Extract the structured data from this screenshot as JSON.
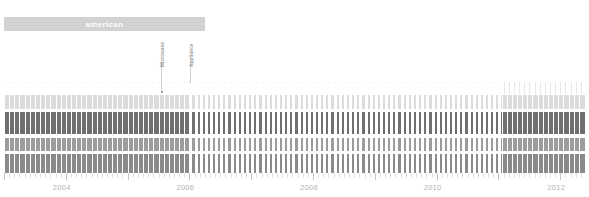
{
  "banner": {
    "label": "american",
    "color": "#d2d2d2",
    "text_color": "#ffffff"
  },
  "annotations": [
    {
      "label": "Microwave",
      "x": 161
    },
    {
      "label": "Appliance",
      "x": 190
    }
  ],
  "axis": {
    "ticks": [
      "2004",
      "2006",
      "2008",
      "2010",
      "2012"
    ],
    "color": "#b4b4b4"
  },
  "chart_data": {
    "type": "bar",
    "title": "american",
    "xlabel": "",
    "ylabel": "",
    "xlim": [
      2003.0,
      2012.4
    ],
    "grid": false,
    "legend": "none",
    "tick_labels": [
      "2004",
      "2006",
      "2008",
      "2010",
      "2012"
    ],
    "tick_values": [
      2004,
      2006,
      2008,
      2010,
      2012
    ],
    "annotations": [
      {
        "text": "Microwave",
        "x": 2005.6
      },
      {
        "text": "Appliance",
        "x": 2006.05
      }
    ],
    "series": [
      {
        "name": "band-1",
        "color": "#dcdcdc",
        "y_top": 95,
        "y_bottom": 109
      },
      {
        "name": "band-2",
        "color": "#6f6f6f",
        "y_top": 112,
        "y_bottom": 134
      },
      {
        "name": "band-3",
        "color": "#9c9c9c",
        "y_top": 138,
        "y_bottom": 151
      },
      {
        "name": "band-4",
        "color": "#8a8a8a",
        "y_top": 154,
        "y_bottom": 173
      }
    ],
    "segments": [
      {
        "name": "dense-left",
        "x_start": 2003.0,
        "x_end": 2006.0,
        "density": "solid"
      },
      {
        "name": "sparse-middle",
        "x_start": 2006.0,
        "x_end": 2011.05,
        "density": "striped"
      },
      {
        "name": "dense-right",
        "x_start": 2011.05,
        "x_end": 2012.35,
        "density": "solid"
      }
    ],
    "values": [
      1,
      1,
      1,
      1,
      1,
      1,
      1,
      1,
      1,
      1
    ]
  }
}
